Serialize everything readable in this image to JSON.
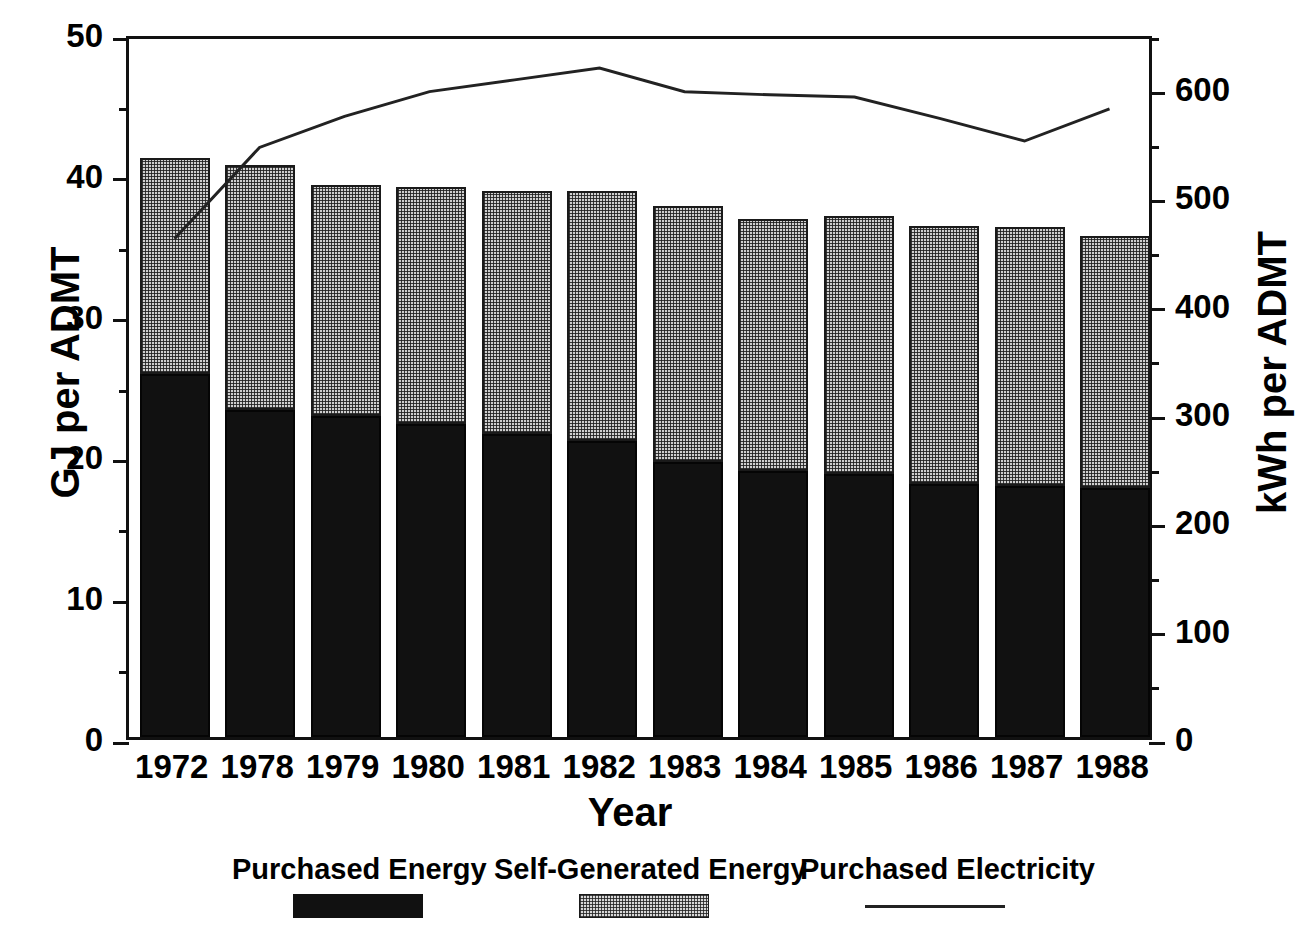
{
  "chart_data": {
    "type": "bar",
    "title": "",
    "subtitle": "",
    "xlabel": "Year",
    "ylabel": "GJ per ADMT",
    "y2label": "kWh per ADMT",
    "categories": [
      "1972",
      "1978",
      "1979",
      "1980",
      "1981",
      "1982",
      "1983",
      "1984",
      "1985",
      "1986",
      "1987",
      "1988"
    ],
    "ylim": [
      0,
      50
    ],
    "y2lim": [
      0,
      650
    ],
    "yticks": [
      0,
      10,
      20,
      30,
      40,
      50
    ],
    "yticklabels": [
      "0",
      "10",
      "20",
      "30",
      "40",
      "50"
    ],
    "yminorticks": [
      5,
      15,
      25,
      35,
      45
    ],
    "y2ticks": [
      0,
      100,
      200,
      300,
      400,
      500,
      600
    ],
    "y2ticklabels": [
      "0",
      "100",
      "200",
      "300",
      "400",
      "500",
      "600"
    ],
    "y2minorticks": [
      50,
      150,
      250,
      350,
      450,
      550,
      650
    ],
    "grid": false,
    "legend_position": "bottom",
    "stacked": true,
    "series": [
      {
        "name": "Purchased Energy",
        "kind": "bar",
        "axis": "left",
        "unit": "GJ per ADMT",
        "fill": "solid-black",
        "values": [
          25.8,
          23.2,
          22.8,
          22.2,
          21.5,
          21.0,
          19.5,
          18.9,
          18.7,
          18.0,
          17.8,
          17.7
        ]
      },
      {
        "name": "Self-Generated Energy",
        "kind": "bar",
        "axis": "left",
        "unit": "GJ per ADMT",
        "fill": "stipple-gray",
        "values": [
          15.3,
          17.4,
          16.4,
          16.9,
          17.3,
          17.8,
          18.2,
          17.9,
          18.3,
          18.3,
          18.4,
          17.9
        ]
      },
      {
        "name": "Stacked Total",
        "kind": "derived-bar-total",
        "axis": "left",
        "unit": "GJ per ADMT",
        "values": [
          41.1,
          40.6,
          39.2,
          39.1,
          38.8,
          38.8,
          37.7,
          36.8,
          37.0,
          36.3,
          36.2,
          35.6
        ]
      },
      {
        "name": "Purchased Electricity",
        "kind": "line",
        "axis": "right",
        "unit": "kWh per ADMT",
        "values": [
          464,
          549,
          578,
          601,
          612,
          623,
          601,
          598,
          596,
          576,
          555,
          585
        ]
      }
    ]
  },
  "axes": {
    "left": {
      "title": "GJ per ADMT"
    },
    "right": {
      "title": "kWh per ADMT"
    },
    "bottom": {
      "title": "Year"
    }
  },
  "legend": {
    "items": [
      {
        "label": "Purchased Energy",
        "swatch": "solid-black-swatch"
      },
      {
        "label": "Self-Generated Energy",
        "swatch": "stipple-gray-swatch"
      },
      {
        "label": "Purchased Electricity",
        "swatch": "line-swatch"
      }
    ]
  },
  "colors": {
    "purchased_energy": "#111111",
    "self_generated_energy": "#cfcfcf",
    "purchased_electricity_line": "#222222",
    "axis": "#111111",
    "background": "#ffffff"
  }
}
